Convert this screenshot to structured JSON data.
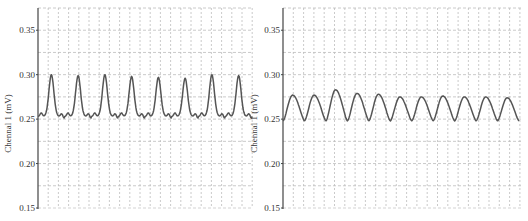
{
  "chart_data": [
    {
      "type": "line",
      "title": "",
      "xlabel": "",
      "ylabel": "Chennal 1 (mV)",
      "ylim": [
        0.15,
        0.375
      ],
      "yticks": [
        "0.35",
        "0.30",
        "0.25",
        "0.20",
        "0.15"
      ],
      "grid": true,
      "legend": null,
      "series": [
        {
          "name": "Channel 1",
          "color": "#555555",
          "peaks": [
            0.3,
            0.299,
            0.3,
            0.298,
            0.297,
            0.296,
            0.3,
            0.299
          ],
          "baseline": 0.253,
          "peak_count": 8
        }
      ]
    },
    {
      "type": "line",
      "title": "",
      "xlabel": "",
      "ylabel": "Chennal 1 (mV)",
      "ylim": [
        0.15,
        0.375
      ],
      "yticks": [
        "0.35",
        "0.30",
        "0.25",
        "0.20",
        "0.15"
      ],
      "grid": true,
      "legend": null,
      "series": [
        {
          "name": "Channel 1",
          "color": "#555555",
          "peaks": [
            0.277,
            0.277,
            0.283,
            0.279,
            0.278,
            0.275,
            0.275,
            0.276,
            0.275,
            0.275,
            0.274
          ],
          "baseline": 0.248,
          "peak_count": 11
        }
      ]
    }
  ],
  "left": {
    "ylabel": "Chennal 1 (mV)",
    "ticks": [
      "0.35",
      "0.30",
      "0.25",
      "0.20",
      "0.15"
    ]
  },
  "right": {
    "ylabel": "Chennal 1 (mV)",
    "ticks": [
      "0.35",
      "0.30",
      "0.25",
      "0.20",
      "0.15"
    ]
  }
}
